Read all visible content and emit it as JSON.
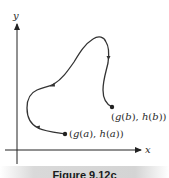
{
  "figure": {
    "axes": {
      "x_label": "x",
      "y_label": "y"
    },
    "points": {
      "start": {
        "label_parts": [
          "(g(",
          "a",
          "), ",
          "h",
          "(",
          "a",
          "))"
        ],
        "text": "(g(a), h(a))"
      },
      "end": {
        "label_parts": [
          "(g(",
          "b",
          "), ",
          "h",
          "(",
          "b",
          "))"
        ],
        "text": "(g(b), h(b))"
      }
    },
    "curve_description": "Parametric curve traced from (g(a), h(a)) to (g(b), h(b)) with direction arrows",
    "colors": {
      "curve": "#333333",
      "axis": "#222222",
      "caption_bg": "#d6d6d6"
    }
  },
  "caption": {
    "text": "Figure 9.12c"
  }
}
